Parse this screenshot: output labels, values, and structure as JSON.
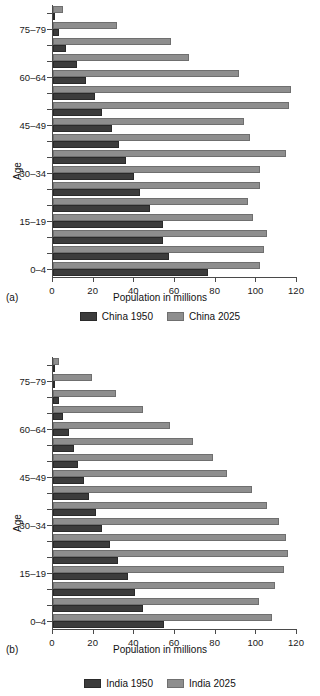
{
  "chart_data": [
    {
      "type": "bar",
      "orientation": "horizontal",
      "panel_tag": "(a)",
      "title": "",
      "xlabel": "Population in millions",
      "ylabel": "Age",
      "xlim": [
        0,
        120
      ],
      "xticks": [
        0,
        20,
        40,
        60,
        80,
        100,
        120
      ],
      "xticklabels": [
        "0",
        "20",
        "40",
        "60",
        "80",
        "100",
        "120"
      ],
      "grid": false,
      "legend_position": "bottom",
      "categories": [
        "0-4",
        "5-9",
        "10-14",
        "15-19",
        "20-24",
        "25-29",
        "30-34",
        "35-39",
        "40-44",
        "45-49",
        "50-54",
        "55-59",
        "60-64",
        "65-69",
        "70-74",
        "75-79",
        "80+"
      ],
      "ytick_labels": [
        "0–4",
        "15–19",
        "30–34",
        "45–49",
        "60–64",
        "75–79"
      ],
      "ytick_categories": [
        "0-4",
        "15-19",
        "30-34",
        "45-49",
        "60-64",
        "75-79"
      ],
      "series": [
        {
          "name": "China 1950",
          "color": "#3c3c3c",
          "values": [
            76,
            57,
            54,
            54,
            47.5,
            43,
            40,
            36,
            32.5,
            29,
            24,
            20.5,
            16,
            12,
            6.5,
            3,
            0.5
          ]
        },
        {
          "name": "China 2025",
          "color": "#8e8e8e",
          "values": [
            102,
            104,
            105,
            98.5,
            96,
            102,
            102,
            114.5,
            97,
            94,
            116,
            117,
            91.5,
            67,
            58,
            31.5,
            5
          ]
        }
      ]
    },
    {
      "type": "bar",
      "orientation": "horizontal",
      "panel_tag": "(b)",
      "title": "",
      "xlabel": "Population in millions",
      "ylabel": "Age",
      "xlim": [
        0,
        120
      ],
      "xticks": [
        0,
        20,
        40,
        60,
        80,
        100,
        120
      ],
      "xticklabels": [
        "0",
        "20",
        "40",
        "60",
        "80",
        "100",
        "120"
      ],
      "grid": false,
      "legend_position": "bottom",
      "categories": [
        "0-4",
        "5-9",
        "10-14",
        "15-19",
        "20-24",
        "25-29",
        "30-34",
        "35-39",
        "40-44",
        "45-49",
        "50-54",
        "55-59",
        "60-64",
        "65-69",
        "70-74",
        "75-79",
        "80+"
      ],
      "ytick_labels": [
        "0–4",
        "15–19",
        "30–34",
        "45–49",
        "60–64",
        "75–79"
      ],
      "ytick_categories": [
        "0-4",
        "15-19",
        "30-34",
        "45-49",
        "60-64",
        "75-79"
      ],
      "series": [
        {
          "name": "India 1950",
          "color": "#3c3c3c",
          "values": [
            54.5,
            44.5,
            40.5,
            37,
            32,
            28,
            24,
            21,
            17.5,
            15,
            12.5,
            10.5,
            8,
            5,
            3,
            1,
            0.3
          ]
        },
        {
          "name": "India 2025",
          "color": "#8e8e8e",
          "values": [
            107.5,
            101.5,
            109,
            113.5,
            115.5,
            114.5,
            111,
            105,
            98,
            85.5,
            78.5,
            69,
            57.5,
            44.5,
            31,
            19,
            3
          ]
        }
      ]
    }
  ],
  "legends": [
    {
      "items": [
        {
          "label": "China 1950",
          "swatch": "old"
        },
        {
          "label": "China 2025",
          "swatch": "new"
        }
      ]
    },
    {
      "items": [
        {
          "label": "India 1950",
          "swatch": "old"
        },
        {
          "label": "India 2025",
          "swatch": "new"
        }
      ]
    }
  ]
}
